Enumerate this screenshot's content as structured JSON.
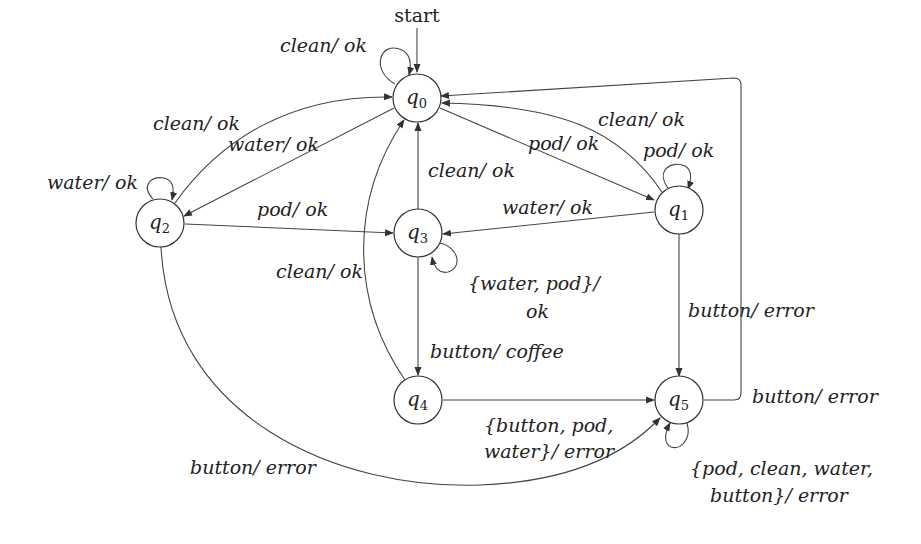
{
  "diagram": {
    "type": "finite-state-machine (Mealy)",
    "start_label": "start",
    "states": [
      {
        "id": "q0",
        "label": "q",
        "sub": "0"
      },
      {
        "id": "q1",
        "label": "q",
        "sub": "1"
      },
      {
        "id": "q2",
        "label": "q",
        "sub": "2"
      },
      {
        "id": "q3",
        "label": "q",
        "sub": "3"
      },
      {
        "id": "q4",
        "label": "q",
        "sub": "4"
      },
      {
        "id": "q5",
        "label": "q",
        "sub": "5"
      }
    ],
    "transitions": [
      {
        "from": "q0",
        "to": "q0",
        "label": "clean/ ok"
      },
      {
        "from": "q0",
        "to": "q1",
        "label": "pod/ ok"
      },
      {
        "from": "q0",
        "to": "q2",
        "label": "water/ ok"
      },
      {
        "from": "q1",
        "to": "q0",
        "label": "clean/ ok"
      },
      {
        "from": "q1",
        "to": "q1",
        "label": "pod/ ok"
      },
      {
        "from": "q1",
        "to": "q3",
        "label": "water/ ok"
      },
      {
        "from": "q1",
        "to": "q5",
        "label": "button/ error"
      },
      {
        "from": "q2",
        "to": "q0",
        "label": "clean/ ok"
      },
      {
        "from": "q2",
        "to": "q2",
        "label": "water/ ok"
      },
      {
        "from": "q2",
        "to": "q3",
        "label": "pod/ ok"
      },
      {
        "from": "q2",
        "to": "q5",
        "label": "button/ error"
      },
      {
        "from": "q3",
        "to": "q0",
        "label": "clean/ ok"
      },
      {
        "from": "q3",
        "to": "q3",
        "label_line1": "{water, pod}/",
        "label_line2": "ok"
      },
      {
        "from": "q3",
        "to": "q4",
        "label": "button/ coffee"
      },
      {
        "from": "q4",
        "to": "q0",
        "label": "clean/ ok"
      },
      {
        "from": "q4",
        "to": "q5",
        "label_line1": "{button, pod,",
        "label_line2": "water}/ error"
      },
      {
        "from": "q5",
        "to": "q0",
        "label": "button/ error"
      },
      {
        "from": "q5",
        "to": "q5",
        "label_line1": "{pod, clean, water,",
        "label_line2": "button}/ error"
      }
    ]
  }
}
